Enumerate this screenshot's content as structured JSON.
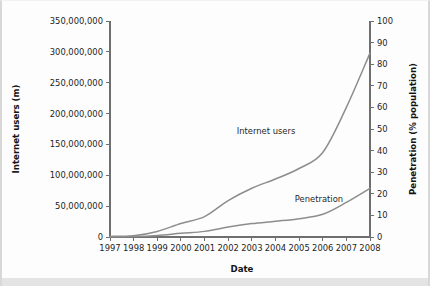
{
  "chart_data": {
    "type": "line",
    "title": "",
    "xlabel": "Date",
    "ylabel": "Internet users (m)",
    "y2label": "Penetration (% population)",
    "grid": false,
    "legend_position": "inline-annotation",
    "x": [
      1997,
      1998,
      1999,
      2000,
      2001,
      2002,
      2003,
      2004,
      2005,
      2006,
      2007,
      2008
    ],
    "xlim": [
      1997,
      2008
    ],
    "xticklabels": [
      "1997",
      "1998",
      "1999",
      "2000",
      "2001",
      "2002",
      "2003",
      "2004",
      "2005",
      "2006",
      "2007",
      "2008"
    ],
    "ylim": [
      0,
      350000000
    ],
    "yticks": [
      0,
      50000000,
      100000000,
      150000000,
      200000000,
      250000000,
      300000000,
      350000000
    ],
    "yticklabels": [
      "0",
      "50,000,000",
      "100,000,000",
      "150,000,000",
      "200,000,000",
      "250,000,000",
      "300,000,000",
      "350,000,000"
    ],
    "y2lim": [
      0,
      100
    ],
    "y2ticks": [
      0,
      10,
      20,
      30,
      40,
      50,
      60,
      70,
      80,
      90,
      100
    ],
    "y2ticklabels": [
      "0",
      "10",
      "20",
      "30",
      "40",
      "50",
      "60",
      "70",
      "80",
      "90",
      "100"
    ],
    "series": [
      {
        "name": "Internet users",
        "axis": "left",
        "units": "users",
        "color": "#8d8d8d",
        "annotation": "Internet users",
        "values": [
          1000000,
          2000000,
          9000000,
          22000000,
          33000000,
          59000000,
          79000000,
          94000000,
          111000000,
          137000000,
          210000000,
          298000000
        ]
      },
      {
        "name": "Penetration",
        "axis": "right",
        "units": "percent",
        "color": "#8d8d8d",
        "annotation": "Penetration",
        "values": [
          0.1,
          0.2,
          0.7,
          1.7,
          2.6,
          4.6,
          6.2,
          7.3,
          8.5,
          10.5,
          16.0,
          22.5
        ]
      }
    ]
  },
  "annotations": {
    "internet_users_label": "Internet users",
    "penetration_label": "Penetration"
  }
}
